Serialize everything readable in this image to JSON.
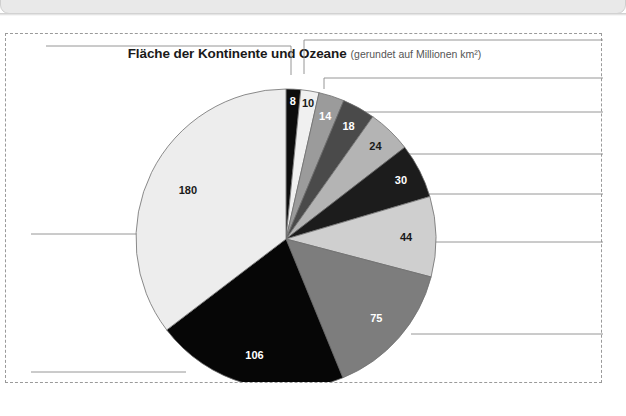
{
  "window": {
    "chrome_present": true
  },
  "figure": {
    "title": "Fläche der Kontinente und Ozeane",
    "subtitle": "(gerundet auf Millionen km²)",
    "frame_style": "dashed"
  },
  "chart_data": {
    "type": "pie",
    "title": "Fläche der Kontinente und Ozeane",
    "subtitle": "(gerundet auf Millionen km²)",
    "unit": "Millionen km²",
    "xlabel": "",
    "ylabel": "",
    "legend": "none",
    "grid": false,
    "total": 509,
    "start_angle_deg": -90,
    "direction": "clockwise",
    "categories": [
      "8",
      "10",
      "14",
      "18",
      "24",
      "30",
      "44",
      "75",
      "106",
      "180"
    ],
    "values": [
      8,
      10,
      14,
      18,
      24,
      30,
      44,
      75,
      106,
      180
    ],
    "slices": [
      {
        "label": "8",
        "value": 8,
        "color": "#0d0d0d",
        "label_color": "#ffffff",
        "leader": "top-left"
      },
      {
        "label": "10",
        "value": 10,
        "color": "#f0f0f0",
        "label_color": "#1a1a1a",
        "leader": "top-right"
      },
      {
        "label": "14",
        "value": 14,
        "color": "#9b9b9b",
        "label_color": "#ffffff",
        "leader": "right"
      },
      {
        "label": "18",
        "value": 18,
        "color": "#4a4a4a",
        "label_color": "#ffffff",
        "leader": "right"
      },
      {
        "label": "24",
        "value": 24,
        "color": "#b4b4b4",
        "label_color": "#1a1a1a",
        "leader": "right"
      },
      {
        "label": "30",
        "value": 30,
        "color": "#1c1c1c",
        "label_color": "#ffffff",
        "leader": "right"
      },
      {
        "label": "44",
        "value": 44,
        "color": "#cfcfcf",
        "label_color": "#1a1a1a",
        "leader": "right"
      },
      {
        "label": "75",
        "value": 75,
        "color": "#7d7d7d",
        "label_color": "#ffffff",
        "leader": "right"
      },
      {
        "label": "106",
        "value": 106,
        "color": "#060606",
        "label_color": "#ffffff",
        "leader": "bottom-left"
      },
      {
        "label": "180",
        "value": 180,
        "color": "#ededed",
        "label_color": "#1a1a1a",
        "leader": "left"
      }
    ],
    "colors": {
      "outline": "#6f6f6f",
      "leader_line": "#8a8a8a",
      "background": "#ffffff"
    }
  }
}
